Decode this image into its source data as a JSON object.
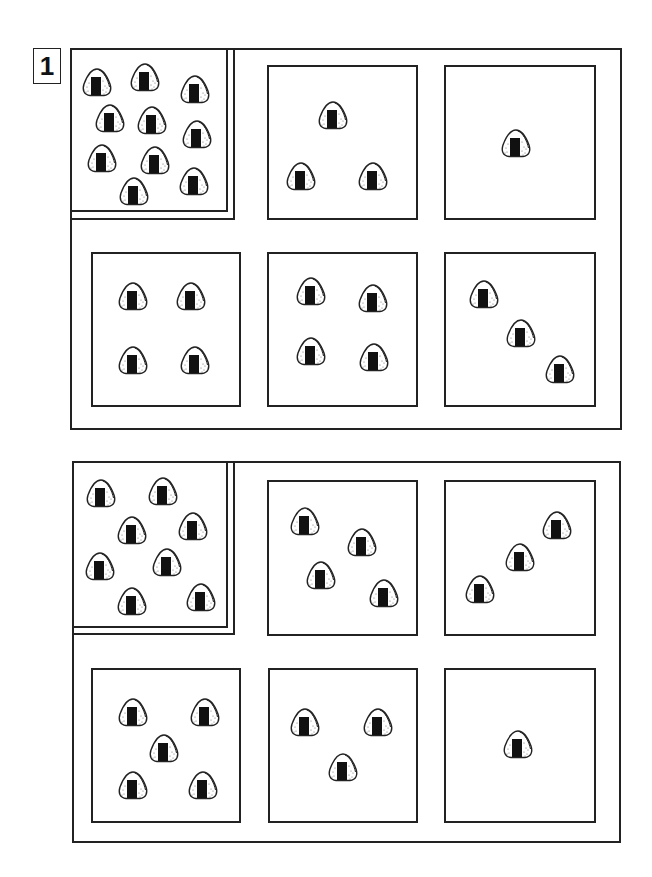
{
  "worksheet": {
    "problem_number": "1",
    "colors": {
      "line": "#222222",
      "nori": "#111111",
      "background": "#ffffff"
    },
    "item_icon": "onigiri-icon",
    "groups": [
      {
        "name": "group-1",
        "frame": {
          "x": 70,
          "y": 48,
          "w": 552,
          "h": 382
        },
        "sample": {
          "count": 10,
          "inner": {
            "x": 70,
            "y": 48,
            "w": 158,
            "h": 164
          },
          "outer": {
            "x": 70,
            "y": 48,
            "w": 165,
            "h": 172
          },
          "items": [
            [
              97,
              82
            ],
            [
              145,
              77
            ],
            [
              195,
              89
            ],
            [
              110,
              118
            ],
            [
              152,
              120
            ],
            [
              197,
              134
            ],
            [
              102,
              158
            ],
            [
              155,
              160
            ],
            [
              134,
              191
            ],
            [
              194,
              181
            ]
          ]
        },
        "boxes": [
          {
            "count": 3,
            "x": 267,
            "y": 65,
            "w": 151,
            "h": 155,
            "items": [
              [
                333,
                115
              ],
              [
                301,
                176
              ],
              [
                373,
                176
              ]
            ]
          },
          {
            "count": 1,
            "x": 444,
            "y": 65,
            "w": 152,
            "h": 155,
            "items": [
              [
                516,
                143
              ]
            ]
          },
          {
            "count": 4,
            "x": 91,
            "y": 252,
            "w": 150,
            "h": 155,
            "items": [
              [
                133,
                296
              ],
              [
                191,
                296
              ],
              [
                133,
                360
              ],
              [
                195,
                360
              ]
            ]
          },
          {
            "count": 4,
            "x": 267,
            "y": 252,
            "w": 151,
            "h": 155,
            "items": [
              [
                311,
                291
              ],
              [
                373,
                298
              ],
              [
                311,
                351
              ],
              [
                374,
                357
              ]
            ]
          },
          {
            "count": 3,
            "x": 444,
            "y": 252,
            "w": 152,
            "h": 155,
            "items": [
              [
                484,
                294
              ],
              [
                521,
                333
              ],
              [
                560,
                369
              ]
            ]
          }
        ]
      },
      {
        "name": "group-2",
        "frame": {
          "x": 72,
          "y": 461,
          "w": 549,
          "h": 382
        },
        "sample": {
          "count": 8,
          "inner": {
            "x": 72,
            "y": 461,
            "w": 156,
            "h": 167
          },
          "outer": {
            "x": 72,
            "y": 461,
            "w": 163,
            "h": 174
          },
          "items": [
            [
              101,
              493
            ],
            [
              163,
              491
            ],
            [
              132,
              530
            ],
            [
              193,
              526
            ],
            [
              100,
              566
            ],
            [
              167,
              562
            ],
            [
              132,
              601
            ],
            [
              201,
              597
            ]
          ]
        },
        "boxes": [
          {
            "count": 4,
            "x": 267,
            "y": 480,
            "w": 151,
            "h": 156,
            "items": [
              [
                305,
                521
              ],
              [
                362,
                542
              ],
              [
                321,
                575
              ],
              [
                384,
                593
              ]
            ]
          },
          {
            "count": 3,
            "x": 444,
            "y": 480,
            "w": 152,
            "h": 156,
            "items": [
              [
                557,
                525
              ],
              [
                520,
                557
              ],
              [
                480,
                589
              ]
            ]
          },
          {
            "count": 5,
            "x": 91,
            "y": 668,
            "w": 150,
            "h": 155,
            "items": [
              [
                133,
                712
              ],
              [
                205,
                712
              ],
              [
                164,
                748
              ],
              [
                133,
                785
              ],
              [
                203,
                785
              ]
            ]
          },
          {
            "count": 3,
            "x": 268,
            "y": 668,
            "w": 150,
            "h": 155,
            "items": [
              [
                305,
                722
              ],
              [
                378,
                722
              ],
              [
                343,
                767
              ]
            ]
          },
          {
            "count": 1,
            "x": 444,
            "y": 668,
            "w": 152,
            "h": 155,
            "items": [
              [
                518,
                744
              ]
            ]
          }
        ]
      }
    ]
  }
}
